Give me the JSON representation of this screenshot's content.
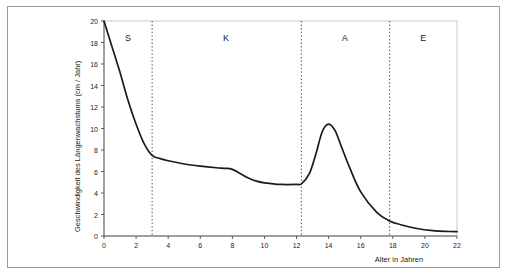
{
  "chart_data": {
    "type": "line",
    "title": "",
    "xlabel": "Alter in Jahren",
    "ylabel": "Geschwindigkeit des Längenwachstums (cm / Jahr)",
    "xlim": [
      0,
      22
    ],
    "ylim": [
      0,
      20
    ],
    "xticks": [
      0,
      2,
      4,
      6,
      8,
      10,
      12,
      14,
      16,
      18,
      20,
      22
    ],
    "yticks": [
      0,
      2,
      4,
      6,
      8,
      10,
      12,
      14,
      16,
      18,
      20
    ],
    "grid": false,
    "legend": "none",
    "line_color": "#1a1a1a",
    "series": [
      {
        "name": "Längenwachstumsgeschwindigkeit",
        "x": [
          0,
          0.5,
          1,
          1.5,
          2,
          2.5,
          3,
          3.5,
          4,
          5,
          6,
          7,
          7.5,
          8,
          8.5,
          9,
          9.5,
          10,
          11,
          12,
          12.3,
          12.8,
          13.2,
          13.6,
          14,
          14.4,
          14.8,
          15.3,
          16,
          17,
          17.8,
          18.5,
          19.5,
          20.5,
          21.5,
          22
        ],
        "values": [
          20.0,
          17.6,
          15.2,
          12.6,
          10.4,
          8.6,
          7.5,
          7.2,
          7.0,
          6.7,
          6.5,
          6.35,
          6.3,
          6.2,
          5.8,
          5.4,
          5.1,
          4.95,
          4.8,
          4.8,
          4.85,
          5.8,
          7.6,
          9.7,
          10.4,
          9.8,
          8.3,
          6.4,
          4.1,
          2.2,
          1.4,
          1.05,
          0.7,
          0.5,
          0.42,
          0.4
        ]
      }
    ],
    "dividers": [
      {
        "x": 3,
        "style": "dotted"
      },
      {
        "x": 12.3,
        "style": "dotted"
      },
      {
        "x": 17.8,
        "style": "dotted"
      }
    ],
    "phases": [
      {
        "label": "S",
        "center_x": 1.5
      },
      {
        "label": "K",
        "center_x": 7.6
      },
      {
        "label": "A",
        "center_x": 15.0
      },
      {
        "label": "E",
        "center_x": 19.9
      }
    ]
  }
}
